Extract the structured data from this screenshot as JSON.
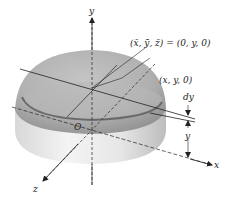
{
  "figure": {
    "axes": {
      "x_label": "x",
      "y_label": "y",
      "z_label": "z",
      "origin_label": "O"
    },
    "annotations": {
      "centroid": "(x̄, ȳ, z̄) = (0, y, 0)",
      "point": "(x, y, 0)",
      "thickness": "dy",
      "height": "y"
    },
    "colors": {
      "surface_light": "#f2f2f2",
      "surface_mid": "#cfcfcf",
      "surface_dark": "#9a9a9a",
      "line": "#222222"
    }
  }
}
